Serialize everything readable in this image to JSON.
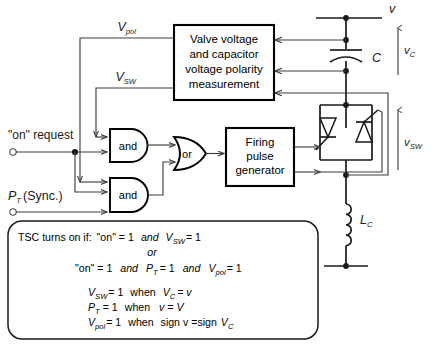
{
  "figure": {
    "type": "circuit-control-block-diagram"
  },
  "blocks": {
    "measurement": {
      "name": "valve-voltage-measurement-block",
      "lines": [
        "Valve voltage",
        "and capacitor",
        "voltage polarity",
        "measurement"
      ]
    },
    "firing": {
      "name": "firing-pulse-generator-block",
      "lines": [
        "Firing",
        "pulse",
        "generator"
      ]
    }
  },
  "gates": {
    "and_top": "and",
    "and_bottom": "and",
    "or": "or"
  },
  "inputs": {
    "on_request": "\"on\" request",
    "sync_label": "(Sync.)",
    "sync_symbol": "P",
    "sync_sub": "T"
  },
  "signals": {
    "vpol": {
      "base": "V",
      "sub": "pol"
    },
    "vsw": {
      "base": "V",
      "sub": "SW"
    }
  },
  "circuit": {
    "bus_label": "v",
    "capacitor_label": "C",
    "inductor_label": "L",
    "inductor_sub": "C",
    "vc_label": {
      "base": "v",
      "sub": "C"
    },
    "vsw_label": {
      "base": "v",
      "sub": "SW"
    }
  },
  "logic_box": {
    "name": "tsc-logic-conditions",
    "line1": {
      "lead": "TSC turns on if:",
      "a": "\"on\" = 1",
      "op": "and",
      "b_base": "V",
      "b_sub": "SW",
      "b_val": "= 1"
    },
    "line2": "or",
    "line3": {
      "a": "\"on\" = 1",
      "op1": "and",
      "b_base": "P",
      "b_sub": "T",
      "b_val": "= 1",
      "op2": "and",
      "c_base": "V",
      "c_sub": "pol",
      "c_val": "= 1"
    },
    "line4": {
      "lhs_base": "V",
      "lhs_sub": "SW",
      "lhs_val": "= 1",
      "when": "when",
      "rhs_base": "V",
      "rhs_sub": "C",
      "rhs_val": "= v"
    },
    "line5": {
      "lhs_base": "P",
      "lhs_sub": "T",
      "lhs_val": "= 1",
      "when": "when",
      "rhs": "v = V"
    },
    "line6": {
      "lhs_base": "V",
      "lhs_sub": "pol",
      "lhs_val": "= 1",
      "when": "when",
      "rhs_pre": "sign v =sign",
      "rhs_base": "V",
      "rhs_sub": "C"
    }
  },
  "colors": {
    "line": "#3d3d3d",
    "heavy": "#1a1a1a",
    "background": "#ffffff"
  }
}
